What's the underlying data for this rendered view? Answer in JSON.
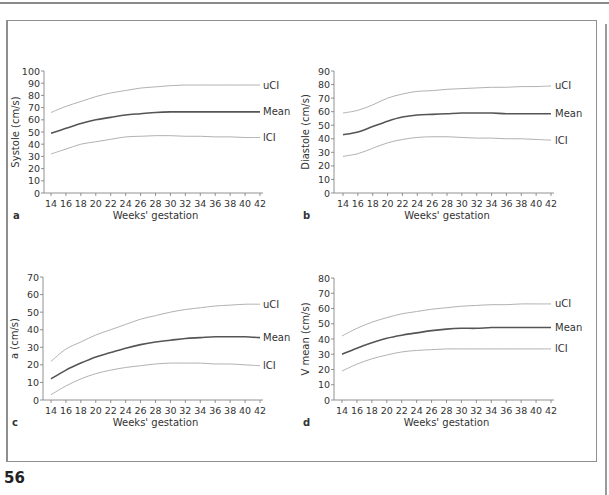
{
  "page": {
    "number": "56"
  },
  "x_axis": {
    "label": "Weeks' gestation",
    "ticks": [
      14,
      16,
      18,
      20,
      22,
      24,
      26,
      28,
      30,
      32,
      34,
      36,
      38,
      40,
      42
    ]
  },
  "series_names": {
    "upper": "uCI",
    "mean": "Mean",
    "lower": "lCI"
  },
  "colors": {
    "mean": "#555555",
    "ci": "#a8a8a8",
    "axis": "#777777"
  },
  "chart_data": [
    {
      "panel": "a",
      "type": "line",
      "title": "",
      "xlabel": "Weeks' gestation",
      "ylabel": "Systole (cm/s)",
      "ylim": [
        0,
        100
      ],
      "yticks": [
        0,
        10,
        20,
        30,
        40,
        50,
        60,
        70,
        80,
        90,
        100
      ],
      "xlim": [
        14,
        42
      ],
      "grid": false,
      "legend_position": "right, inline labels",
      "x": [
        14,
        16,
        18,
        20,
        22,
        24,
        26,
        28,
        30,
        32,
        34,
        36,
        38,
        40,
        42
      ],
      "series": [
        {
          "name": "uCI",
          "values": [
            66,
            71,
            75,
            79,
            82,
            84,
            86,
            87,
            88,
            88.5,
            88.5,
            88.5,
            88.5,
            88.5,
            88.5
          ]
        },
        {
          "name": "Mean",
          "values": [
            49,
            53,
            57,
            60,
            62,
            64,
            65,
            66,
            66.5,
            66.5,
            66.5,
            66.5,
            66.5,
            66.5,
            66.5
          ]
        },
        {
          "name": "lCI",
          "values": [
            32,
            36,
            40,
            42,
            44,
            46,
            46.5,
            47,
            47,
            46.5,
            46.5,
            46,
            46,
            45.5,
            45.5
          ]
        }
      ]
    },
    {
      "panel": "b",
      "type": "line",
      "title": "",
      "xlabel": "Weeks' gestation",
      "ylabel": "Diastole (cm/s)",
      "ylim": [
        0,
        90
      ],
      "yticks": [
        0,
        10,
        20,
        30,
        40,
        50,
        60,
        70,
        80,
        90
      ],
      "xlim": [
        14,
        42
      ],
      "grid": false,
      "legend_position": "right, inline labels",
      "x": [
        14,
        16,
        18,
        20,
        22,
        24,
        26,
        28,
        30,
        32,
        34,
        36,
        38,
        40,
        42
      ],
      "series": [
        {
          "name": "uCI",
          "values": [
            59,
            61,
            65,
            70,
            73,
            75,
            75.5,
            76.5,
            77,
            77.5,
            78,
            78,
            78.5,
            78.5,
            79
          ]
        },
        {
          "name": "Mean",
          "values": [
            43,
            45,
            49,
            53,
            56,
            57.5,
            58,
            58.5,
            59,
            59,
            59,
            58.5,
            58.5,
            58.5,
            58.5
          ]
        },
        {
          "name": "lCI",
          "values": [
            27,
            29,
            33,
            37,
            39.5,
            41,
            41.5,
            41.5,
            41,
            40.5,
            40.5,
            40,
            40,
            39.5,
            39
          ]
        }
      ]
    },
    {
      "panel": "c",
      "type": "line",
      "title": "",
      "xlabel": "Weeks' gestation",
      "ylabel": "a (cm/s)",
      "ylim": [
        0,
        70
      ],
      "yticks": [
        0,
        10,
        20,
        30,
        40,
        50,
        60,
        70
      ],
      "xlim": [
        14,
        42
      ],
      "grid": false,
      "legend_position": "right, inline labels",
      "x": [
        14,
        16,
        18,
        20,
        22,
        24,
        26,
        28,
        30,
        32,
        34,
        36,
        38,
        40,
        42
      ],
      "series": [
        {
          "name": "uCI",
          "values": [
            22,
            29,
            33,
            37,
            40,
            43,
            46,
            48,
            50,
            51.5,
            52.5,
            53.5,
            54,
            54.5,
            54.5
          ]
        },
        {
          "name": "Mean",
          "values": [
            12,
            17,
            21,
            24.5,
            27,
            29.5,
            31.5,
            33,
            34,
            35,
            35.5,
            36,
            36,
            36,
            35.5
          ]
        },
        {
          "name": "lCI",
          "values": [
            3,
            8,
            12,
            15,
            17,
            18.5,
            19.5,
            20.5,
            21,
            21,
            21,
            20.5,
            20.5,
            20,
            19.5
          ]
        }
      ]
    },
    {
      "panel": "d",
      "type": "line",
      "title": "",
      "xlabel": "Weeks' gestation",
      "ylabel": "V mean (cm/s)",
      "ylim": [
        0,
        80
      ],
      "yticks": [
        0,
        10,
        20,
        30,
        40,
        50,
        60,
        70,
        80
      ],
      "xlim": [
        14,
        42
      ],
      "grid": false,
      "legend_position": "right, inline labels",
      "x": [
        14,
        16,
        18,
        20,
        22,
        24,
        26,
        28,
        30,
        32,
        34,
        36,
        38,
        40,
        42
      ],
      "series": [
        {
          "name": "uCI",
          "values": [
            42,
            47,
            51,
            54,
            56.5,
            58,
            59.5,
            60.5,
            61.5,
            62,
            62.5,
            62.5,
            63,
            63,
            63
          ]
        },
        {
          "name": "Mean",
          "values": [
            30,
            34,
            37.5,
            40.5,
            42.5,
            44,
            45.5,
            46.5,
            47,
            47,
            47.5,
            47.5,
            47.5,
            47.5,
            47.5
          ]
        },
        {
          "name": "lCI",
          "values": [
            19,
            23.5,
            27,
            29.5,
            31.5,
            32.5,
            33,
            33.5,
            33.5,
            33.5,
            33.5,
            33.5,
            33.5,
            33.5,
            33.5
          ]
        }
      ]
    }
  ],
  "layout": [
    {
      "left": 0,
      "top": 60,
      "axisX": 44,
      "x14": 51,
      "x42": 260,
      "yTop": 71,
      "yBottom": 193,
      "labelX": 263
    },
    {
      "left": 0,
      "top": 60,
      "axisX": 334,
      "x14": 343,
      "x42": 551,
      "yTop": 71,
      "yBottom": 193,
      "labelX": 555
    },
    {
      "left": 0,
      "top": 265,
      "axisX": 43,
      "x14": 51,
      "x42": 260,
      "yTop": 277,
      "yBottom": 400,
      "labelX": 263
    },
    {
      "left": 0,
      "top": 265,
      "axisX": 334,
      "x14": 342,
      "x42": 551,
      "yTop": 278,
      "yBottom": 400,
      "labelX": 555
    }
  ]
}
